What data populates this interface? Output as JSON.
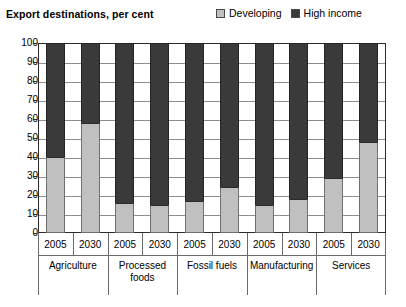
{
  "chart_data": {
    "type": "bar",
    "title": "Export destinations, per cent",
    "subtitle": "",
    "xlabel": "",
    "ylabel": "",
    "ylim": [
      0,
      100
    ],
    "yticks": [
      0,
      10,
      20,
      30,
      40,
      50,
      60,
      70,
      80,
      90,
      100
    ],
    "grid": true,
    "stacked": true,
    "stack_total": 100,
    "legend_position": "top-right",
    "categories": [
      "Agriculture 2005",
      "Agriculture 2030",
      "Processed foods 2005",
      "Processed foods 2030",
      "Fossil fuels 2005",
      "Fossil fuels 2030",
      "Manufacturing 2005",
      "Manufacturing 2030",
      "Services 2005",
      "Services 2030"
    ],
    "groups": [
      {
        "name": "Agriculture",
        "years": [
          "2005",
          "2030"
        ]
      },
      {
        "name": "Processed foods",
        "years": [
          "2005",
          "2030"
        ]
      },
      {
        "name": "Fossil fuels",
        "years": [
          "2005",
          "2030"
        ]
      },
      {
        "name": "Manufacturing",
        "years": [
          "2005",
          "2030"
        ]
      },
      {
        "name": "Services",
        "years": [
          "2005",
          "2030"
        ]
      }
    ],
    "series": [
      {
        "name": "Developing",
        "color": "#c0c0c0",
        "values": [
          40,
          58,
          16,
          15,
          17,
          24,
          15,
          18,
          29,
          48
        ]
      },
      {
        "name": "High income",
        "color": "#3a3a3a",
        "values": [
          60,
          42,
          84,
          85,
          83,
          76,
          85,
          82,
          71,
          52
        ]
      }
    ]
  },
  "legend": {
    "items": [
      {
        "label": "Developing",
        "color": "#c0c0c0",
        "swatch": "legend-swatch-developing"
      },
      {
        "label": "High income",
        "color": "#3a3a3a",
        "swatch": "legend-swatch-high-income"
      }
    ]
  },
  "colors": {
    "developing": "#c0c0c0",
    "high_income": "#3a3a3a",
    "axis": "#2b2b2b",
    "gridline": "#8d8d8d",
    "background": "#ffffff"
  }
}
